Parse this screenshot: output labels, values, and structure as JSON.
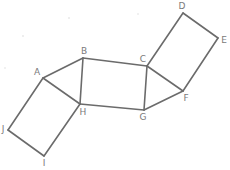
{
  "figure": {
    "title": "",
    "vertices": [
      {
        "id": "A",
        "label": "A"
      },
      {
        "id": "B",
        "label": "B"
      },
      {
        "id": "C",
        "label": "C"
      },
      {
        "id": "D",
        "label": "D"
      },
      {
        "id": "E",
        "label": "E"
      },
      {
        "id": "F",
        "label": "F"
      },
      {
        "id": "G",
        "label": "G"
      },
      {
        "id": "H",
        "label": "H"
      },
      {
        "id": "I",
        "label": "I"
      },
      {
        "id": "J",
        "label": "J"
      }
    ],
    "edges": [
      [
        "A",
        "B"
      ],
      [
        "B",
        "C"
      ],
      [
        "C",
        "G"
      ],
      [
        "G",
        "H"
      ],
      [
        "H",
        "B"
      ],
      [
        "A",
        "H"
      ],
      [
        "C",
        "D"
      ],
      [
        "D",
        "E"
      ],
      [
        "E",
        "F"
      ],
      [
        "F",
        "C"
      ],
      [
        "F",
        "G"
      ],
      [
        "A",
        "J"
      ],
      [
        "J",
        "I"
      ],
      [
        "I",
        "H"
      ]
    ],
    "shapes": [
      {
        "name": "square-BCGH",
        "vertices": [
          "B",
          "C",
          "G",
          "H"
        ]
      },
      {
        "name": "square-CDEF",
        "vertices": [
          "C",
          "D",
          "E",
          "F"
        ]
      },
      {
        "name": "square-AHIJ",
        "vertices": [
          "A",
          "H",
          "I",
          "J"
        ]
      },
      {
        "name": "triangle-ABH",
        "vertices": [
          "A",
          "B",
          "H"
        ]
      },
      {
        "name": "triangle-CFG",
        "vertices": [
          "C",
          "F",
          "G"
        ]
      }
    ],
    "colors": {
      "line": "#6b6b6b",
      "label": "#7a7a7a",
      "background": "#ffffff"
    }
  }
}
